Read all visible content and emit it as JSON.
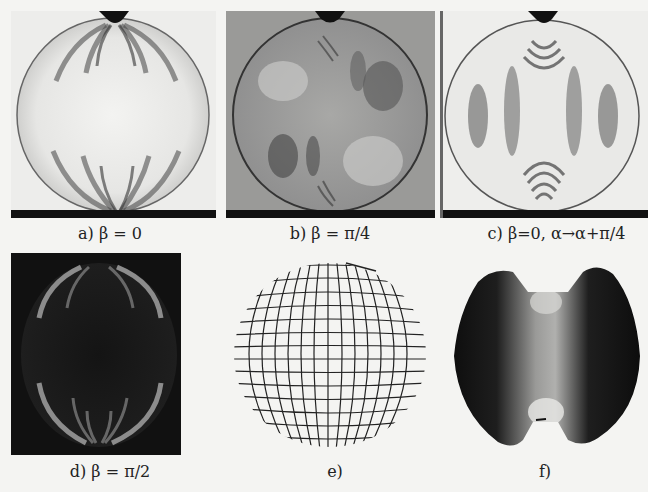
{
  "figure": {
    "panels": [
      {
        "id": "a",
        "caption": "a) β = 0",
        "description": "photoelastic fringe pattern, light field, dark fringes near top and bottom contacts"
      },
      {
        "id": "b",
        "caption": "b) β = π/4",
        "description": "photoelastic fringe pattern on grey background"
      },
      {
        "id": "c",
        "caption": "c) β=0,  α→α+π/4",
        "description": "isochromatic fringes, vertical dark bands with concentric arcs at contacts"
      },
      {
        "id": "d",
        "caption": "d) β = π/2",
        "description": "dark field pattern with bright fringes near contacts"
      },
      {
        "id": "e",
        "caption": "e)",
        "description": "principal stress direction grid (isostatics) inside disc"
      },
      {
        "id": "f",
        "caption": "f)",
        "description": "dark disc with light vertical central band"
      }
    ],
    "colors": {
      "background": "#f4f4f2",
      "dark": "#111111",
      "grey_panel": "#9a9a98",
      "light_panel": "#eeeeec"
    }
  }
}
